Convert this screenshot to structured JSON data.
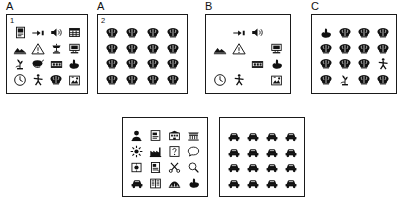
{
  "figure": {
    "panels": [
      {
        "id": "panel-a1",
        "label": "A",
        "inner_number": "1",
        "columns": 4,
        "icons": [
          "document-icon",
          "pointing-hand-icon",
          "loudspeaker-icon",
          "grid-table-icon",
          "mountain-icon",
          "warning-triangle-icon",
          "telephone-icon",
          "computer-monitor-icon",
          "plant-icon",
          "paint-roller-icon",
          "film-strip-icon",
          "hand-gesture-icon",
          "clock-icon",
          "running-person-icon",
          "brain-icon",
          "picture-frame-icon"
        ]
      },
      {
        "id": "panel-a2",
        "label": "A",
        "inner_number": "2",
        "columns": 4,
        "icons": [
          "brain-icon",
          "brain-icon",
          "brain-icon",
          "brain-icon",
          "brain-icon",
          "brain-icon",
          "brain-icon",
          "brain-icon",
          "brain-icon",
          "brain-icon",
          "brain-icon",
          "brain-icon",
          "brain-icon",
          "brain-icon",
          "brain-icon",
          "brain-icon"
        ]
      },
      {
        "id": "panel-b",
        "label": "B",
        "inner_number": "",
        "columns": 4,
        "icons": [
          "blank",
          "pointing-hand-icon",
          "loudspeaker-icon",
          "blank",
          "mountain-icon",
          "warning-triangle-icon",
          "blank",
          "computer-monitor-icon",
          "blank",
          "blank",
          "film-strip-icon",
          "hand-gesture-icon",
          "clock-icon",
          "running-person-icon",
          "blank",
          "picture-frame-icon"
        ]
      },
      {
        "id": "panel-c",
        "label": "C",
        "inner_number": "",
        "columns": 4,
        "icons": [
          "hand-gesture-icon",
          "brain-icon",
          "brain-icon",
          "brain-icon",
          "brain-icon",
          "brain-icon",
          "brain-icon",
          "brain-icon",
          "brain-icon",
          "brain-icon",
          "brain-icon",
          "running-person-icon",
          "brain-icon",
          "plant-icon",
          "brain-icon",
          "brain-icon"
        ]
      },
      {
        "id": "panel-d",
        "label": "",
        "inner_number": "",
        "columns": 4,
        "icons": [
          "person-head-icon",
          "note-page-icon",
          "building-icon",
          "bench-icon",
          "sun-flower-icon",
          "factory-icon",
          "question-box-icon",
          "speech-bubble-icon",
          "boxed-symbol-icon",
          "open-page-icon",
          "scissors-icon",
          "magnifier-icon",
          "car-icon",
          "open-book-icon",
          "bridge-icon",
          "hand-gesture-icon"
        ]
      },
      {
        "id": "panel-e",
        "label": "",
        "inner_number": "",
        "columns": 4,
        "icons": [
          "car-icon",
          "car-icon",
          "car-icon",
          "car-icon",
          "car-icon",
          "car-icon",
          "car-icon",
          "car-icon",
          "car-icon",
          "car-icon",
          "car-icon",
          "car-icon",
          "car-icon",
          "car-icon",
          "car-icon",
          "car-icon"
        ]
      }
    ],
    "colors": {
      "border": "#1a1a1a",
      "icon": "#111111",
      "background": "#ffffff"
    }
  }
}
